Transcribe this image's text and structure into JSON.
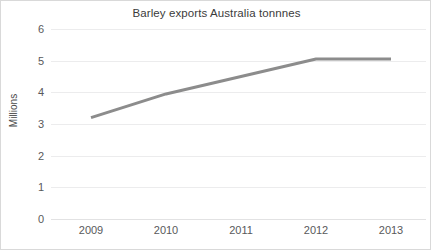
{
  "chart_data": {
    "type": "line",
    "title": "Barley exports Australia tonnnes",
    "xlabel": "",
    "ylabel": "Millions",
    "categories": [
      "2009",
      "2010",
      "2011",
      "2012",
      "2013"
    ],
    "series": [
      {
        "name": "Barley exports",
        "values": [
          3.2,
          3.95,
          4.5,
          5.05,
          5.05
        ],
        "color": "#8c8c8c",
        "line_width": 3,
        "markers": false
      }
    ],
    "ylim": [
      0,
      6
    ],
    "y_ticks": [
      "0",
      "1",
      "2",
      "3",
      "4",
      "5",
      "6"
    ],
    "y_tick_values": [
      0,
      1,
      2,
      3,
      4,
      5,
      6
    ],
    "x_ticks": [
      "2009",
      "2010",
      "2011",
      "2012",
      "2013"
    ],
    "grid": {
      "horizontal": true,
      "vertical": false,
      "color": "#ececed"
    },
    "legend": {
      "visible": false,
      "position": "none"
    },
    "background": "#ffffff",
    "border_color": "#d9d9d9"
  }
}
